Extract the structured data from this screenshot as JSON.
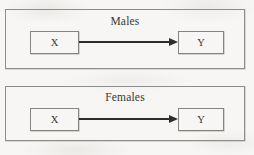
{
  "figure": {
    "background_color": "#f7f6f4",
    "line_color": "#2e2d2a",
    "border_color": "#8e8d89",
    "text_color": "#37362f"
  },
  "panels": [
    {
      "id": "males",
      "title": "Males",
      "nodes": [
        {
          "id": "x",
          "label": "X"
        },
        {
          "id": "y",
          "label": "Y"
        }
      ],
      "edges": [
        {
          "from": "X",
          "to": "Y",
          "style": "solid",
          "arrowhead": "filled-triangle",
          "direction": "right"
        }
      ]
    },
    {
      "id": "females",
      "title": "Females",
      "nodes": [
        {
          "id": "x",
          "label": "X"
        },
        {
          "id": "y",
          "label": "Y"
        }
      ],
      "edges": [
        {
          "from": "X",
          "to": "Y",
          "style": "solid",
          "arrowhead": "filled-triangle",
          "direction": "right"
        }
      ]
    }
  ]
}
